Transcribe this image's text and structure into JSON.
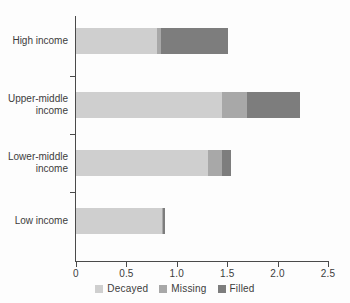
{
  "chart_data": {
    "type": "bar",
    "orientation": "horizontal",
    "stacked": true,
    "title": "",
    "xlabel": "",
    "ylabel": "",
    "categories": [
      "High income",
      "Upper-middle income",
      "Lower-middle income",
      "Low income"
    ],
    "series": [
      {
        "name": "Decayed",
        "color": "#cfcfcf",
        "values": [
          0.8,
          1.45,
          1.31,
          0.85
        ]
      },
      {
        "name": "Missing",
        "color": "#a8a8a8",
        "values": [
          0.04,
          0.25,
          0.14,
          0.01
        ]
      },
      {
        "name": "Filled",
        "color": "#7d7d7d",
        "values": [
          0.67,
          0.52,
          0.09,
          0.02
        ]
      }
    ],
    "totals": [
      1.51,
      2.22,
      1.54,
      0.88
    ],
    "xlim": [
      0,
      2.5
    ],
    "xticks": [
      0,
      0.5,
      1.0,
      1.5,
      2.0,
      2.5
    ],
    "xtick_labels": [
      "0",
      "0.5",
      "1.0",
      "1.5",
      "2.0",
      "2.5"
    ],
    "grid": false,
    "legend_position": "bottom"
  },
  "axis": {
    "x_tick_labels": [
      "0",
      "0.5",
      "1.0",
      "1.5",
      "2.0",
      "2.5"
    ]
  },
  "categories": [
    {
      "label": "High income"
    },
    {
      "label": "Upper-middle\nincome"
    },
    {
      "label": "Lower-middle\nincome"
    },
    {
      "label": "Low income"
    }
  ],
  "legend": {
    "items": [
      {
        "label": "Decayed",
        "color": "#cfcfcf"
      },
      {
        "label": "Missing",
        "color": "#a8a8a8"
      },
      {
        "label": "Filled",
        "color": "#7d7d7d"
      }
    ]
  }
}
